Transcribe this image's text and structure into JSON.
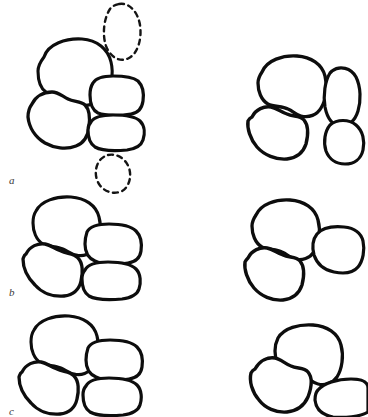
{
  "figure": {
    "title": "",
    "background_color": "#ffffff",
    "ink_color": "#0d0d0d",
    "width": 368,
    "height": 417,
    "style": "hand-drawn line diagram, black outlines on white, no fill",
    "row_labels": [
      {
        "id": "a",
        "text": "a",
        "x": 9,
        "y": 175
      },
      {
        "id": "b",
        "text": "b",
        "x": 9,
        "y": 287
      },
      {
        "id": "c",
        "text": "c",
        "x": 9,
        "y": 406
      }
    ],
    "rows": [
      {
        "id": "a",
        "label": "a",
        "panels": [
          {
            "id": "a-left",
            "name": "row-a-left-panel",
            "blob_count": 4,
            "ghost_outline_count": 2,
            "description": "cluster of four rounded blobs with two dashed ghost ellipses above and below"
          },
          {
            "id": "a-right",
            "name": "row-a-right-panel",
            "blob_count": 4,
            "ghost_outline_count": 0,
            "description": "cluster of four rounded blobs, two large left, two small right"
          }
        ]
      },
      {
        "id": "b",
        "label": "b",
        "panels": [
          {
            "id": "b-left",
            "name": "row-b-left-panel",
            "blob_count": 4,
            "ghost_outline_count": 0,
            "description": "cluster of four rounded blobs"
          },
          {
            "id": "b-right",
            "name": "row-b-right-panel",
            "blob_count": 3,
            "ghost_outline_count": 0,
            "description": "cluster of three rounded blobs"
          }
        ]
      },
      {
        "id": "c",
        "label": "c",
        "panels": [
          {
            "id": "c-left",
            "name": "row-c-left-panel",
            "blob_count": 4,
            "ghost_outline_count": 0,
            "description": "cluster of four rounded blobs"
          },
          {
            "id": "c-right",
            "name": "row-c-right-panel",
            "blob_count": 3,
            "ghost_outline_count": 0,
            "description": "cluster of three rounded blobs, one wedge shaped"
          }
        ]
      }
    ],
    "shapes": {
      "a_left": [
        {
          "name": "blob-a-left-top",
          "stroke_width": 3.1,
          "d": "M 44 57 C 48 44 66 38 82 39 C 97 40 108 49 111 62 C 114 74 111 87 105 95 C 99 103 88 107 78 105 C 74 104 71 101 67 99 C 60 96 52 96 46 92 C 40 88 38 79 38 71 C 38 66 41 61 44 57 Z"
        },
        {
          "name": "blob-a-left-bottom",
          "stroke_width": 3.3,
          "d": "M 32 104 C 36 96 44 92 52 92 C 58 92 62 96 68 99 C 74 102 81 101 85 105 C 90 110 90 119 89 127 C 88 136 84 143 76 146 C 66 150 54 148 45 143 C 35 137 29 127 28 117 C 28 111 29 108 32 104 Z"
        },
        {
          "name": "blob-a-right-top",
          "stroke_width": 3.2,
          "d": "M 93 83 C 96 78 104 76 113 76 C 123 76 133 77 138 81 C 143 86 144 94 143 101 C 142 108 138 113 131 114 C 120 116 106 116 98 113 C 92 110 90 103 90 95 C 90 90 91 86 93 83 Z"
        },
        {
          "name": "blob-a-right-bottom",
          "stroke_width": 3.2,
          "d": "M 91 122 C 94 117 103 115 113 115 C 124 115 135 116 140 121 C 145 126 145 134 143 140 C 141 146 135 149 127 150 C 116 151 102 151 95 147 C 89 143 88 136 88 130 C 88 126 89 124 91 122 Z"
        }
      ],
      "a_left_ghosts": [
        {
          "name": "ghost-ellipse-top",
          "stroke_width": 2.4,
          "dash": "5 4.5",
          "d": "M 119 4 C 129 2 138 12 140 25 C 142 39 138 53 129 58 C 120 63 110 57 106 46 C 102 34 104 18 110 9 C 112 6 115 5 119 4 Z"
        },
        {
          "name": "ghost-ellipse-bottom",
          "stroke_width": 2.4,
          "dash": "5 4.5",
          "d": "M 108 155 C 117 153 126 159 129 168 C 132 177 129 187 122 191 C 114 195 104 192 99 184 C 94 176 95 165 101 159 C 103 157 105 156 108 155 Z"
        }
      ],
      "a_right": [
        {
          "name": "blob-a2-top-left",
          "stroke_width": 3.3,
          "d": "M 262 72 C 267 60 283 55 297 56 C 311 57 322 64 325 76 C 328 87 326 100 321 108 C 317 115 309 118 301 116 C 296 115 293 111 288 109 C 282 106 274 107 268 104 C 261 100 258 91 258 83 C 258 78 260 75 262 72 Z"
        },
        {
          "name": "blob-a2-bottom-left",
          "stroke_width": 3.4,
          "d": "M 252 117 C 256 109 264 106 271 107 C 277 108 281 112 287 114 C 293 117 300 115 304 120 C 309 126 308 136 306 144 C 303 153 296 158 287 159 C 276 160 264 155 257 147 C 250 139 247 128 248 121 C 249 119 250 118 252 117 Z"
        },
        {
          "name": "blob-a2-right-upper",
          "stroke_width": 3.2,
          "d": "M 332 71 C 340 65 351 68 356 77 C 361 87 361 101 358 111 C 355 121 348 127 340 126 C 332 125 327 117 325 107 C 323 95 325 81 330 73 Z"
        },
        {
          "name": "blob-a2-right-lower",
          "stroke_width": 3.2,
          "d": "M 330 125 C 337 119 349 119 356 125 C 363 131 365 141 363 150 C 361 159 354 164 345 164 C 336 164 329 159 326 151 C 323 142 325 131 330 125 Z"
        }
      ],
      "b_left": [
        {
          "name": "blob-b-top-left",
          "stroke_width": 3.1,
          "d": "M 36 211 C 41 201 56 196 71 197 C 85 198 96 205 99 217 C 102 228 100 241 95 248 C 91 254 83 257 76 255 C 71 254 68 251 63 249 C 57 246 49 247 43 244 C 36 240 33 231 33 223 C 33 218 34 214 36 211 Z"
        },
        {
          "name": "blob-b-bottom-left",
          "stroke_width": 3.3,
          "d": "M 26 254 C 30 246 38 243 45 244 C 51 245 55 249 61 251 C 67 254 74 253 78 258 C 83 263 83 273 81 281 C 79 290 73 295 64 296 C 53 297 42 293 35 285 C 27 277 23 267 23 259 C 24 256 24 255 26 254 Z"
        },
        {
          "name": "blob-b-top-right",
          "stroke_width": 3.2,
          "d": "M 87 232 C 90 226 99 224 109 224 C 120 224 131 226 136 231 C 141 236 142 244 141 251 C 140 258 135 262 128 263 C 117 265 103 265 95 261 C 88 258 85 251 85 244 C 85 239 86 235 87 232 Z"
        },
        {
          "name": "blob-b-bottom-right",
          "stroke_width": 3.2,
          "d": "M 85 270 C 88 264 97 262 108 262 C 119 262 131 264 136 269 C 141 274 141 283 139 289 C 137 295 130 298 122 299 C 110 300 96 300 89 296 C 83 292 82 285 82 279 C 82 275 83 272 85 270 Z"
        }
      ],
      "b_right": [
        {
          "name": "blob-b2-top",
          "stroke_width": 3.3,
          "d": "M 256 215 C 261 204 276 199 290 200 C 304 201 315 208 318 220 C 321 231 319 244 314 252 C 310 258 302 261 295 259 C 290 258 287 254 282 252 C 276 249 268 250 262 247 C 255 243 252 234 252 226 C 252 221 254 218 256 215 Z"
        },
        {
          "name": "blob-b2-bottom",
          "stroke_width": 3.4,
          "d": "M 248 258 C 252 250 260 247 267 248 C 273 249 277 253 283 255 C 289 258 296 256 300 261 C 305 267 304 277 302 285 C 299 294 292 299 283 300 C 272 301 261 296 254 288 C 247 280 244 269 245 262 C 246 260 247 259 248 258 Z"
        },
        {
          "name": "blob-b2-right",
          "stroke_width": 3.2,
          "d": "M 317 234 C 322 228 333 226 344 227 C 354 228 361 233 363 241 C 365 250 363 261 358 267 C 353 273 344 274 334 272 C 324 270 317 264 314 255 C 312 247 313 239 317 234 Z"
        }
      ],
      "c_left": [
        {
          "name": "blob-c-top-left",
          "stroke_width": 3.1,
          "d": "M 34 330 C 39 320 54 315 69 316 C 83 317 94 324 97 336 C 100 347 98 360 93 367 C 89 373 81 376 74 374 C 69 373 66 370 61 368 C 55 365 47 366 41 363 C 34 359 31 350 31 342 C 31 337 32 333 34 330 Z"
        },
        {
          "name": "blob-c-bottom-left",
          "stroke_width": 3.3,
          "d": "M 22 372 C 26 364 34 361 41 362 C 47 363 51 367 57 369 C 63 372 70 371 74 376 C 79 381 79 391 77 399 C 75 408 69 413 60 414 C 49 415 38 411 31 403 C 23 395 19 385 19 377 C 20 374 20 373 22 372 Z"
        },
        {
          "name": "blob-c-top-right",
          "stroke_width": 3.2,
          "d": "M 88 348 C 91 342 100 340 110 340 C 121 340 132 342 137 347 C 142 352 143 360 142 367 C 141 374 136 378 129 379 C 118 381 104 381 96 377 C 89 374 86 367 86 360 C 86 355 87 351 88 348 Z"
        },
        {
          "name": "blob-c-bottom-right",
          "stroke_width": 3.2,
          "d": "M 86 386 C 89 380 98 378 109 378 C 120 378 132 380 137 385 C 142 390 142 399 140 405 C 138 411 131 414 123 415 C 111 416 97 416 90 412 C 84 408 83 401 83 395 C 83 391 84 388 86 386 Z"
        }
      ],
      "c_right": [
        {
          "name": "blob-c2-top",
          "stroke_width": 3.3,
          "d": "M 278 338 C 284 328 299 324 313 325 C 327 326 338 333 341 345 C 344 356 342 369 337 377 C 333 383 325 386 318 384 C 313 383 310 379 305 377 C 299 374 291 375 285 372 C 278 368 275 359 275 351 C 275 346 276 342 278 338 Z"
        },
        {
          "name": "blob-c2-bottom-left",
          "stroke_width": 3.4,
          "d": "M 255 369 C 260 360 268 357 275 358 C 281 359 285 364 291 366 C 297 369 304 367 308 372 C 313 378 311 389 308 397 C 304 406 296 411 287 412 C 276 413 265 408 259 400 C 252 392 249 381 251 373 C 252 371 253 370 255 369 Z"
        },
        {
          "name": "blob-c2-right-wedge",
          "stroke_width": 3.2,
          "d": "M 318 390 C 324 383 337 379 351 379 C 362 379 368 382 368 388 L 368 412 C 360 417 344 418 333 417 C 322 415 316 409 315 400 C 315 396 316 392 318 390 Z"
        }
      ]
    }
  }
}
